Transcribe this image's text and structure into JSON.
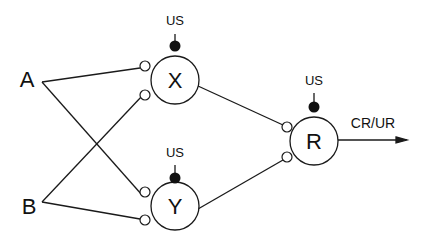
{
  "diagram": {
    "inputs": [
      {
        "id": "A",
        "label": "A"
      },
      {
        "id": "B",
        "label": "B"
      }
    ],
    "nodes": [
      {
        "id": "X",
        "label": "X",
        "us_label": "US"
      },
      {
        "id": "Y",
        "label": "Y",
        "us_label": "US"
      },
      {
        "id": "R",
        "label": "R",
        "us_label": "US"
      }
    ],
    "output": {
      "label": "CR/UR"
    },
    "edges": [
      {
        "from": "A",
        "to": "X"
      },
      {
        "from": "A",
        "to": "Y"
      },
      {
        "from": "B",
        "to": "X"
      },
      {
        "from": "B",
        "to": "Y"
      },
      {
        "from": "X",
        "to": "R"
      },
      {
        "from": "Y",
        "to": "R"
      },
      {
        "from": "R",
        "to": "CR/UR"
      }
    ],
    "colors": {
      "stroke": "#1a1a1a",
      "background": "#ffffff"
    }
  }
}
